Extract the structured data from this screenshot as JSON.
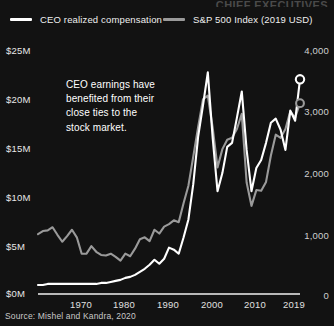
{
  "cut_title": "CHIEF EXECUTIVES",
  "legend": {
    "items": [
      {
        "label": "CEO realized compensation",
        "color": "#ffffff",
        "key": "ceo"
      },
      {
        "label": "S&P 500 Index (2019 USD)",
        "color": "#9a9a9a",
        "key": "sp500"
      }
    ]
  },
  "annotation": {
    "line1": "CEO earnings have",
    "line2": "benefited from their",
    "line3": "close ties to the",
    "line4": "stock market."
  },
  "source": {
    "text": "Source: Mishel and Kandra, 2020"
  },
  "axes": {
    "left_ticks": [
      "$25M",
      "$20M",
      "$15M",
      "$10M",
      "$5M",
      "$0M"
    ],
    "right_ticks": [
      "4,000",
      "3,000",
      "2,000",
      "1,000",
      "0"
    ],
    "x_ticks": [
      "1970",
      "1980",
      "1990",
      "2000",
      "2010",
      "2019"
    ]
  },
  "chart_data": {
    "type": "line",
    "xlabel": "",
    "ylabel": "CEO realized compensation (millions, 2019 USD)",
    "y2label": "S&P 500 Index (2019 USD)",
    "xlim": [
      1965,
      2019
    ],
    "ylim": [
      0,
      26
    ],
    "y2lim": [
      0,
      4160
    ],
    "grid": false,
    "legend_position": "top",
    "background": "#121212",
    "x": [
      1965,
      1966,
      1967,
      1968,
      1969,
      1970,
      1971,
      1972,
      1973,
      1974,
      1975,
      1976,
      1977,
      1978,
      1979,
      1980,
      1981,
      1982,
      1983,
      1984,
      1985,
      1986,
      1987,
      1988,
      1989,
      1990,
      1991,
      1992,
      1993,
      1994,
      1995,
      1996,
      1997,
      1998,
      1999,
      2000,
      2001,
      2002,
      2003,
      2004,
      2005,
      2006,
      2007,
      2008,
      2009,
      2010,
      2011,
      2012,
      2013,
      2014,
      2015,
      2016,
      2017,
      2018,
      2019
    ],
    "series": [
      {
        "name": "CEO realized compensation",
        "color": "#ffffff",
        "axis": "left",
        "unit": "millions USD (2019)",
        "endpoint_marker": true,
        "values": [
          0.9,
          0.9,
          1.0,
          1.0,
          1.0,
          1.0,
          1.0,
          1.0,
          1.0,
          1.0,
          1.0,
          1.0,
          1.0,
          1.1,
          1.1,
          1.2,
          1.3,
          1.4,
          1.6,
          1.7,
          1.9,
          2.2,
          2.5,
          2.9,
          3.4,
          3.0,
          3.5,
          4.6,
          4.4,
          4.0,
          5.6,
          7.4,
          10.9,
          15.6,
          18.7,
          22.0,
          15.5,
          10.2,
          12.0,
          14.6,
          15.0,
          17.5,
          20.1,
          14.3,
          10.2,
          12.5,
          13.3,
          15.0,
          17.0,
          17.4,
          16.3,
          14.3,
          18.2,
          17.2,
          21.3
        ]
      },
      {
        "name": "S&P 500 Index (2019 USD)",
        "color": "#9a9a9a",
        "axis": "right",
        "unit": "index points (2019 USD)",
        "endpoint_marker": true,
        "values": [
          950,
          1000,
          1010,
          1060,
          940,
          830,
          920,
          1020,
          900,
          640,
          640,
          760,
          670,
          620,
          610,
          640,
          590,
          530,
          640,
          600,
          720,
          870,
          900,
          840,
          1020,
          960,
          1070,
          1110,
          1170,
          1140,
          1440,
          1720,
          2180,
          2650,
          3090,
          3150,
          2640,
          2010,
          2300,
          2450,
          2480,
          2620,
          2860,
          1770,
          1400,
          1650,
          1640,
          1780,
          2200,
          2530,
          2480,
          2620,
          2900,
          2800,
          3030
        ]
      }
    ],
    "annotations": [
      {
        "text": "CEO earnings have benefited from their close ties to the stock market.",
        "x": 1978,
        "y": 20
      }
    ]
  }
}
